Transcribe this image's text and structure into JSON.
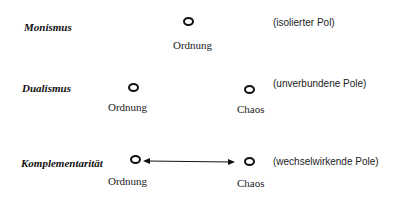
{
  "rows": [
    {
      "concept": "Monismus",
      "description": "(isolierter Pol)",
      "poles": [
        "Ordnung"
      ]
    },
    {
      "concept": "Dualismus",
      "description": "(unverbundene Pole)",
      "poles": [
        "Ordnung",
        "Chaos"
      ]
    },
    {
      "concept": "Komplementarität",
      "description": "(wechselwirkende Pole)",
      "poles": [
        "Ordnung",
        "Chaos"
      ],
      "connector": "bidirectional-arrow"
    }
  ]
}
